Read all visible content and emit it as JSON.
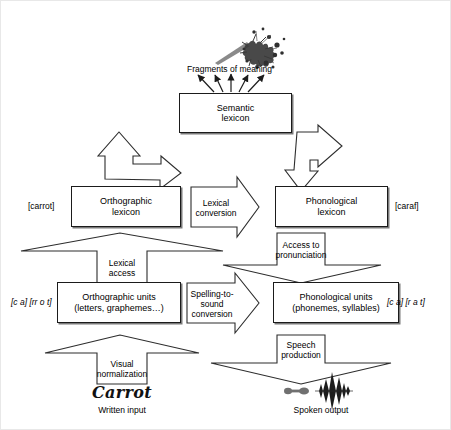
{
  "diagram": {
    "frame_color": "#e8e8e8",
    "box_border_color": "#1b1b1b",
    "arrow_stroke_color": "#3a3a3a"
  },
  "nodes": {
    "semantic_lexicon": "Semantic\nlexicon",
    "semantic_lexicon_line1": "Semantic",
    "semantic_lexicon_line2": "lexicon",
    "orthographic_lexicon_line1": "Orthographic",
    "orthographic_lexicon_line2": "lexicon",
    "phonological_lexicon_line1": "Phonological",
    "phonological_lexicon_line2": "lexicon",
    "orthographic_units_line1": "Orthographic units",
    "orthographic_units_line2": "(letters, graphemes…)",
    "phonological_units_line1": "Phonological units",
    "phonological_units_line2": "(phonemes, syllables)"
  },
  "arrow_labels": {
    "lexical_conversion_line1": "Lexical",
    "lexical_conversion_line2": "conversion",
    "lexical_access_line1": "Lexical",
    "lexical_access_line2": "access",
    "access_to_pronunciation_line1": "Access to",
    "access_to_pronunciation_line2": "pronunciation",
    "spelling_to_sound_line1": "Spelling-to-",
    "spelling_to_sound_line2": "sound",
    "spelling_to_sound_line3": "conversion",
    "visual_normalization_line1": "Visual",
    "visual_normalization_line2": "normalization",
    "speech_production_line1": "Speech",
    "speech_production_line2": "production"
  },
  "side_labels": {
    "orthographic_lexicon_left": "[carrot]",
    "phonological_lexicon_right": "[caraf]",
    "orthographic_units_left": "[c a] [rr o t]",
    "phonological_units_right": "[c a] [r a t]"
  },
  "captions": {
    "fragments_of_meaning": "Fragments of meaning",
    "written_input_word": "Carrot",
    "written_input": "Written input",
    "spoken_output": "Spoken output"
  },
  "icons": {
    "meaning_burst": "meaning-burst-icon",
    "speech_waveform": "speech-waveform-icon"
  }
}
